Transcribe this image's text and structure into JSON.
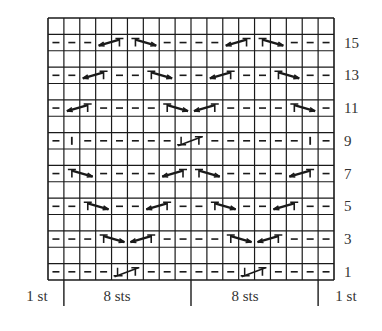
{
  "chart": {
    "type": "knitting-chart",
    "columns": 18,
    "rows": 16,
    "grid_color": "#1a1a1a",
    "symbols": {
      "-": "purl",
      "|": "knit",
      "RC": "right-cross (2-st cable, left-pointing arrow with T)",
      "LC": "left-cross (2-st cable, T with right-pointing arrow)",
      "PC": "purl-cross (2-st twist with inverted T)",
      "": "empty / no stitch (wrong-side row)"
    },
    "grid_rows": [
      {
        "row": 16,
        "label": "",
        "cells": [
          {
            "c": 1,
            "s": ""
          },
          {
            "c": 2,
            "s": ""
          },
          {
            "c": 3,
            "s": ""
          },
          {
            "c": 4,
            "s": ""
          },
          {
            "c": 5,
            "s": ""
          },
          {
            "c": 6,
            "s": ""
          },
          {
            "c": 7,
            "s": ""
          },
          {
            "c": 8,
            "s": ""
          },
          {
            "c": 9,
            "s": ""
          },
          {
            "c": 10,
            "s": ""
          },
          {
            "c": 11,
            "s": ""
          },
          {
            "c": 12,
            "s": ""
          },
          {
            "c": 13,
            "s": ""
          },
          {
            "c": 14,
            "s": ""
          },
          {
            "c": 15,
            "s": ""
          },
          {
            "c": 16,
            "s": ""
          },
          {
            "c": 17,
            "s": ""
          },
          {
            "c": 18,
            "s": ""
          }
        ]
      },
      {
        "row": 15,
        "label": "15",
        "cells": [
          {
            "c": 1,
            "s": "-"
          },
          {
            "c": 2,
            "s": "-"
          },
          {
            "c": 3,
            "s": "-"
          },
          {
            "c": 4,
            "s": "RC",
            "span": 2
          },
          {
            "c": 6,
            "s": "LC",
            "span": 2
          },
          {
            "c": 8,
            "s": "-"
          },
          {
            "c": 9,
            "s": "-"
          },
          {
            "c": 10,
            "s": "-"
          },
          {
            "c": 11,
            "s": "-"
          },
          {
            "c": 12,
            "s": "RC",
            "span": 2
          },
          {
            "c": 14,
            "s": "LC",
            "span": 2
          },
          {
            "c": 16,
            "s": "-"
          },
          {
            "c": 17,
            "s": "-"
          },
          {
            "c": 18,
            "s": "-"
          }
        ]
      },
      {
        "row": 14,
        "label": "",
        "cells": []
      },
      {
        "row": 13,
        "label": "13",
        "cells": [
          {
            "c": 1,
            "s": "-"
          },
          {
            "c": 2,
            "s": "-"
          },
          {
            "c": 3,
            "s": "RC",
            "span": 2
          },
          {
            "c": 5,
            "s": "-"
          },
          {
            "c": 6,
            "s": "-"
          },
          {
            "c": 7,
            "s": "LC",
            "span": 2
          },
          {
            "c": 9,
            "s": "-"
          },
          {
            "c": 10,
            "s": "-"
          },
          {
            "c": 11,
            "s": "RC",
            "span": 2
          },
          {
            "c": 13,
            "s": "-"
          },
          {
            "c": 14,
            "s": "-"
          },
          {
            "c": 15,
            "s": "LC",
            "span": 2
          },
          {
            "c": 17,
            "s": "-"
          },
          {
            "c": 18,
            "s": "-"
          }
        ]
      },
      {
        "row": 12,
        "label": "",
        "cells": []
      },
      {
        "row": 11,
        "label": "11",
        "cells": [
          {
            "c": 1,
            "s": "-"
          },
          {
            "c": 2,
            "s": "RC",
            "span": 2
          },
          {
            "c": 4,
            "s": "-"
          },
          {
            "c": 5,
            "s": "-"
          },
          {
            "c": 6,
            "s": "-"
          },
          {
            "c": 7,
            "s": "-"
          },
          {
            "c": 8,
            "s": "LC",
            "span": 2
          },
          {
            "c": 10,
            "s": "RC",
            "span": 2
          },
          {
            "c": 12,
            "s": "-"
          },
          {
            "c": 13,
            "s": "-"
          },
          {
            "c": 14,
            "s": "-"
          },
          {
            "c": 15,
            "s": "-"
          },
          {
            "c": 16,
            "s": "LC",
            "span": 2
          },
          {
            "c": 18,
            "s": "-"
          }
        ]
      },
      {
        "row": 10,
        "label": "",
        "cells": []
      },
      {
        "row": 9,
        "label": "9",
        "cells": [
          {
            "c": 1,
            "s": "-"
          },
          {
            "c": 2,
            "s": "|"
          },
          {
            "c": 3,
            "s": "-"
          },
          {
            "c": 4,
            "s": "-"
          },
          {
            "c": 5,
            "s": "-"
          },
          {
            "c": 6,
            "s": "-"
          },
          {
            "c": 7,
            "s": "-"
          },
          {
            "c": 8,
            "s": "-"
          },
          {
            "c": 9,
            "s": "PC",
            "span": 2
          },
          {
            "c": 11,
            "s": "-"
          },
          {
            "c": 12,
            "s": "-"
          },
          {
            "c": 13,
            "s": "-"
          },
          {
            "c": 14,
            "s": "-"
          },
          {
            "c": 15,
            "s": "-"
          },
          {
            "c": 16,
            "s": "-"
          },
          {
            "c": 17,
            "s": "|"
          },
          {
            "c": 18,
            "s": "-"
          }
        ]
      },
      {
        "row": 8,
        "label": "",
        "cells": []
      },
      {
        "row": 7,
        "label": "7",
        "cells": [
          {
            "c": 1,
            "s": "-"
          },
          {
            "c": 2,
            "s": "LC",
            "span": 2
          },
          {
            "c": 4,
            "s": "-"
          },
          {
            "c": 5,
            "s": "-"
          },
          {
            "c": 6,
            "s": "-"
          },
          {
            "c": 7,
            "s": "-"
          },
          {
            "c": 8,
            "s": "RC",
            "span": 2
          },
          {
            "c": 10,
            "s": "LC",
            "span": 2
          },
          {
            "c": 12,
            "s": "-"
          },
          {
            "c": 13,
            "s": "-"
          },
          {
            "c": 14,
            "s": "-"
          },
          {
            "c": 15,
            "s": "-"
          },
          {
            "c": 16,
            "s": "RC",
            "span": 2
          },
          {
            "c": 18,
            "s": "-"
          }
        ]
      },
      {
        "row": 6,
        "label": "",
        "cells": []
      },
      {
        "row": 5,
        "label": "5",
        "cells": [
          {
            "c": 1,
            "s": "-"
          },
          {
            "c": 2,
            "s": "-"
          },
          {
            "c": 3,
            "s": "LC",
            "span": 2
          },
          {
            "c": 5,
            "s": "-"
          },
          {
            "c": 6,
            "s": "-"
          },
          {
            "c": 7,
            "s": "RC",
            "span": 2
          },
          {
            "c": 9,
            "s": "-"
          },
          {
            "c": 10,
            "s": "-"
          },
          {
            "c": 11,
            "s": "LC",
            "span": 2
          },
          {
            "c": 13,
            "s": "-"
          },
          {
            "c": 14,
            "s": "-"
          },
          {
            "c": 15,
            "s": "RC",
            "span": 2
          },
          {
            "c": 17,
            "s": "-"
          },
          {
            "c": 18,
            "s": "-"
          }
        ]
      },
      {
        "row": 4,
        "label": "",
        "cells": []
      },
      {
        "row": 3,
        "label": "3",
        "cells": [
          {
            "c": 1,
            "s": "-"
          },
          {
            "c": 2,
            "s": "-"
          },
          {
            "c": 3,
            "s": "-"
          },
          {
            "c": 4,
            "s": "LC",
            "span": 2
          },
          {
            "c": 6,
            "s": "RC",
            "span": 2
          },
          {
            "c": 8,
            "s": "-"
          },
          {
            "c": 9,
            "s": "-"
          },
          {
            "c": 10,
            "s": "-"
          },
          {
            "c": 11,
            "s": "-"
          },
          {
            "c": 12,
            "s": "LC",
            "span": 2
          },
          {
            "c": 14,
            "s": "RC",
            "span": 2
          },
          {
            "c": 16,
            "s": "-"
          },
          {
            "c": 17,
            "s": "-"
          },
          {
            "c": 18,
            "s": "-"
          }
        ]
      },
      {
        "row": 2,
        "label": "",
        "cells": []
      },
      {
        "row": 1,
        "label": "1",
        "cells": [
          {
            "c": 1,
            "s": "-"
          },
          {
            "c": 2,
            "s": "-"
          },
          {
            "c": 3,
            "s": "-"
          },
          {
            "c": 4,
            "s": "-"
          },
          {
            "c": 5,
            "s": "PC",
            "span": 2
          },
          {
            "c": 7,
            "s": "-"
          },
          {
            "c": 8,
            "s": "-"
          },
          {
            "c": 9,
            "s": "-"
          },
          {
            "c": 10,
            "s": "-"
          },
          {
            "c": 11,
            "s": "-"
          },
          {
            "c": 12,
            "s": "-"
          },
          {
            "c": 13,
            "s": "PC",
            "span": 2
          },
          {
            "c": 15,
            "s": "-"
          },
          {
            "c": 16,
            "s": "-"
          },
          {
            "c": 17,
            "s": "-"
          },
          {
            "c": 18,
            "s": "-"
          }
        ]
      }
    ],
    "row_labels": [
      "15",
      "13",
      "11",
      "9",
      "7",
      "5",
      "3",
      "1"
    ],
    "repeat_labels": [
      {
        "text": "1 st",
        "x": 37
      },
      {
        "text": "8 sts",
        "x": 117
      },
      {
        "text": "8 sts",
        "x": 245
      },
      {
        "text": "1 st",
        "x": 346
      }
    ],
    "repeat_marker_columns": [
      1,
      9,
      17
    ]
  }
}
